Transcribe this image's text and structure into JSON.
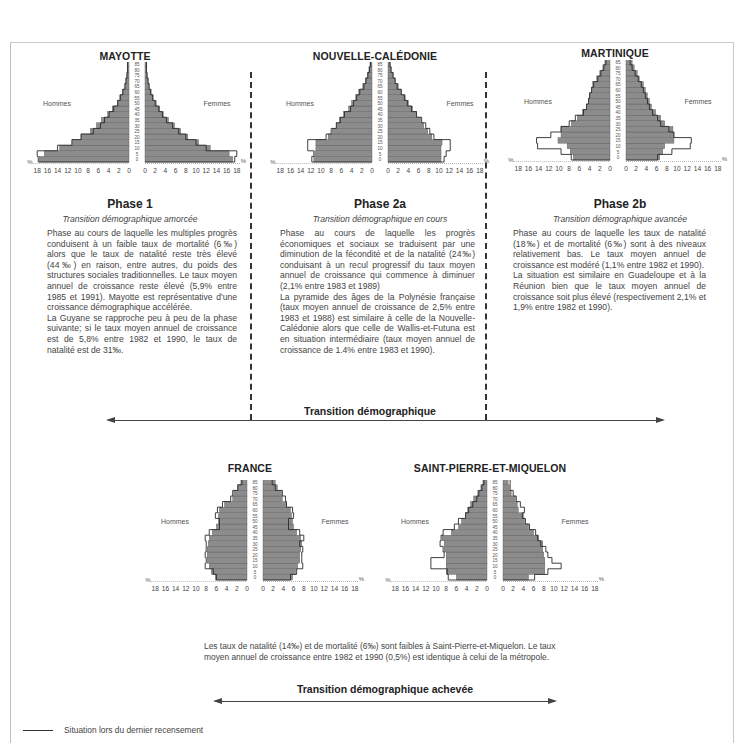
{
  "chart_data": [
    {
      "type": "bar",
      "subtype": "population-pyramid",
      "title": "MAYOTTE",
      "age_groups": [
        "0",
        "5",
        "10",
        "15",
        "20",
        "25",
        "30",
        "35",
        "40",
        "45",
        "50",
        "55",
        "60",
        "65",
        "70",
        "75",
        "80",
        "85",
        "90"
      ],
      "age_unit_label": "ans",
      "axis_ticks": [
        18,
        16,
        14,
        12,
        10,
        8,
        6,
        4,
        2,
        0
      ],
      "axis_unit": "%",
      "left_label": "Hommes",
      "right_label": "Femmes",
      "series": [
        {
          "name": "Hommes (actuel)",
          "values": [
            17.6,
            16.6,
            13.6,
            11.1,
            9.4,
            7.6,
            6.4,
            5.4,
            4.2,
            3.3,
            2.3,
            1.8,
            1.3,
            0.8,
            0.6,
            0.4,
            0.3,
            0.3,
            0.2
          ]
        },
        {
          "name": "Hommes (dernier recensement)",
          "values": [
            17.8,
            18.0,
            14.0,
            11.2,
            9.4,
            7.0,
            5.6,
            4.8,
            3.9,
            3.0,
            2.2,
            1.7,
            1.2,
            0.8,
            0.6,
            0.4,
            0.3,
            0.3,
            0.2
          ]
        },
        {
          "name": "Femmes (actuel)",
          "values": [
            17.2,
            16.5,
            12.8,
            10.5,
            8.4,
            7.0,
            5.8,
            4.6,
            3.6,
            2.9,
            2.2,
            1.6,
            1.2,
            0.8,
            0.6,
            0.4,
            0.3,
            0.3,
            0.2
          ]
        },
        {
          "name": "Femmes (dernier recensement)",
          "values": [
            17.6,
            18.0,
            12.0,
            10.0,
            8.0,
            6.6,
            5.4,
            4.2,
            3.4,
            2.7,
            2.0,
            1.5,
            1.1,
            0.8,
            0.6,
            0.4,
            0.3,
            0.3,
            0.2
          ]
        }
      ],
      "xlim": [
        18,
        18
      ]
    },
    {
      "type": "bar",
      "subtype": "population-pyramid",
      "title": "NOUVELLE-CALÉDONIE",
      "age_groups": [
        "0",
        "5",
        "10",
        "15",
        "20",
        "25",
        "30",
        "35",
        "40",
        "45",
        "50",
        "55",
        "60",
        "65",
        "70",
        "75",
        "80",
        "85",
        "90"
      ],
      "age_unit_label": "ans",
      "axis_ticks": [
        18,
        16,
        14,
        12,
        10,
        8,
        6,
        4,
        2,
        0
      ],
      "axis_unit": "%",
      "left_label": "Hommes",
      "right_label": "Femmes",
      "series": [
        {
          "name": "Hommes (actuel)",
          "values": [
            11.4,
            11.2,
            11.0,
            11.0,
            8.6,
            7.8,
            7.0,
            6.4,
            5.6,
            4.6,
            4.0,
            3.2,
            2.6,
            1.8,
            1.3,
            0.9,
            0.6,
            0.4,
            0.2
          ]
        },
        {
          "name": "Hommes (dernier recensement)",
          "values": [
            11.8,
            11.4,
            12.6,
            12.6,
            9.0,
            8.0,
            7.0,
            6.2,
            5.4,
            4.2,
            3.6,
            3.0,
            2.4,
            1.6,
            1.2,
            0.8,
            0.5,
            0.3,
            0.2
          ]
        },
        {
          "name": "Femmes (actuel)",
          "values": [
            10.4,
            10.4,
            10.4,
            10.6,
            8.6,
            7.8,
            7.0,
            6.4,
            5.6,
            4.8,
            4.0,
            3.4,
            2.6,
            2.0,
            1.4,
            1.0,
            0.6,
            0.4,
            0.2
          ]
        },
        {
          "name": "Femmes (dernier recensement)",
          "values": [
            11.0,
            11.4,
            12.2,
            12.2,
            9.0,
            8.2,
            7.4,
            6.6,
            5.6,
            4.6,
            3.8,
            3.2,
            2.6,
            1.8,
            1.4,
            1.0,
            0.6,
            0.4,
            0.2
          ]
        }
      ],
      "xlim": [
        18,
        18
      ]
    },
    {
      "type": "bar",
      "subtype": "population-pyramid",
      "title": "MARTINIQUE",
      "age_groups": [
        "0",
        "5",
        "10",
        "15",
        "20",
        "25",
        "30",
        "35",
        "40",
        "45",
        "50",
        "55",
        "60",
        "65",
        "70",
        "75",
        "80",
        "85",
        "90"
      ],
      "age_unit_label": "ans",
      "axis_ticks": [
        18,
        16,
        14,
        12,
        10,
        8,
        6,
        4,
        2,
        0
      ],
      "axis_unit": "%",
      "left_label": "Hommes",
      "right_label": "Femmes",
      "series": [
        {
          "name": "Hommes (actuel)",
          "values": [
            7.2,
            7.8,
            8.4,
            10.2,
            9.6,
            9.6,
            7.6,
            6.4,
            5.4,
            4.6,
            4.2,
            4.0,
            3.6,
            3.4,
            2.6,
            2.0,
            1.4,
            1.0,
            0.8
          ]
        },
        {
          "name": "Hommes (dernier recensement)",
          "values": [
            7.6,
            9.6,
            14.2,
            14.4,
            11.6,
            9.6,
            8.0,
            6.8,
            5.2,
            4.6,
            4.2,
            4.0,
            3.6,
            3.2,
            2.4,
            1.8,
            1.2,
            0.8,
            0.6
          ]
        },
        {
          "name": "Femmes (actuel)",
          "values": [
            6.6,
            7.2,
            7.6,
            9.4,
            9.4,
            9.2,
            7.6,
            6.8,
            5.8,
            5.0,
            4.6,
            4.2,
            3.8,
            3.4,
            2.6,
            2.2,
            1.6,
            1.2,
            1.0
          ]
        },
        {
          "name": "Femmes (dernier recensement)",
          "values": [
            6.2,
            9.0,
            12.6,
            12.8,
            9.4,
            8.4,
            6.8,
            6.2,
            5.2,
            4.6,
            4.2,
            3.8,
            3.4,
            3.0,
            2.4,
            1.8,
            1.2,
            0.8,
            0.6
          ]
        }
      ],
      "xlim": [
        18,
        18
      ]
    },
    {
      "type": "bar",
      "subtype": "population-pyramid",
      "title": "FRANCE",
      "age_groups": [
        "0",
        "5",
        "10",
        "15",
        "20",
        "25",
        "30",
        "35",
        "40",
        "45",
        "50",
        "55",
        "60",
        "65",
        "70",
        "75",
        "80",
        "85",
        "90"
      ],
      "age_unit_label": "ans",
      "axis_ticks": [
        18,
        16,
        14,
        12,
        10,
        8,
        6,
        4,
        2,
        0
      ],
      "axis_unit": "%",
      "left_label": "Hommes",
      "right_label": "Femmes",
      "series": [
        {
          "name": "Hommes (actuel)",
          "values": [
            6.2,
            7.0,
            7.4,
            7.8,
            7.8,
            7.8,
            7.6,
            7.4,
            6.8,
            6.0,
            5.6,
            5.6,
            5.4,
            4.4,
            2.8,
            2.6,
            1.8,
            1.2,
            1.2
          ]
        },
        {
          "name": "Hommes (dernier recensement)",
          "values": [
            6.0,
            6.6,
            8.2,
            8.0,
            8.2,
            8.0,
            8.0,
            8.2,
            7.4,
            5.4,
            5.4,
            6.2,
            5.8,
            4.8,
            3.2,
            2.8,
            1.8,
            1.0,
            0.8
          ]
        },
        {
          "name": "Femmes (actuel)",
          "values": [
            5.8,
            6.4,
            6.8,
            7.2,
            7.2,
            7.4,
            7.6,
            7.4,
            6.6,
            6.0,
            5.8,
            5.6,
            5.4,
            4.6,
            3.8,
            3.6,
            2.8,
            2.4,
            2.4
          ]
        },
        {
          "name": "Femmes (dernier recensement)",
          "values": [
            5.4,
            6.6,
            7.8,
            7.6,
            7.6,
            7.8,
            7.2,
            8.0,
            7.2,
            5.0,
            5.0,
            6.0,
            5.8,
            4.6,
            4.4,
            3.8,
            2.4,
            1.8,
            1.8
          ]
        }
      ],
      "xlim": [
        18,
        18
      ]
    },
    {
      "type": "bar",
      "subtype": "population-pyramid",
      "title": "SAINT-PIERRE-ET-MIQUELON",
      "age_groups": [
        "0",
        "5",
        "10",
        "15",
        "20",
        "25",
        "30",
        "35",
        "40",
        "45",
        "50",
        "55",
        "60",
        "65",
        "70",
        "75",
        "80",
        "85",
        "90"
      ],
      "age_unit_label": "ans",
      "axis_ticks": [
        18,
        16,
        14,
        12,
        10,
        8,
        6,
        4,
        2,
        0
      ],
      "axis_unit": "%",
      "left_label": "Hommes",
      "right_label": "Femmes",
      "series": [
        {
          "name": "Hommes (actuel)",
          "values": [
            6.0,
            8.0,
            8.0,
            8.0,
            8.0,
            8.4,
            8.4,
            8.8,
            7.0,
            5.6,
            5.0,
            4.2,
            3.8,
            3.2,
            2.6,
            1.8,
            1.2,
            0.8,
            0.4
          ]
        },
        {
          "name": "Hommes (dernier recensement)",
          "values": [
            7.6,
            7.8,
            11.0,
            11.0,
            8.4,
            8.6,
            9.2,
            9.0,
            8.6,
            6.4,
            5.6,
            4.2,
            3.6,
            2.8,
            2.0,
            1.6,
            1.0,
            0.6,
            0.4
          ]
        },
        {
          "name": "Femmes (actuel)",
          "values": [
            5.0,
            8.2,
            8.2,
            8.2,
            8.0,
            7.8,
            7.8,
            7.0,
            6.0,
            5.0,
            4.2,
            4.0,
            3.0,
            2.8,
            2.4,
            1.6,
            1.2,
            1.0,
            1.0
          ]
        },
        {
          "name": "Femmes (dernier recensement)",
          "values": [
            6.2,
            8.8,
            11.4,
            9.6,
            8.8,
            8.4,
            7.4,
            6.8,
            6.4,
            5.2,
            4.4,
            3.8,
            4.2,
            3.4,
            2.6,
            2.0,
            1.4,
            1.4,
            1.4
          ]
        }
      ],
      "xlim": [
        18,
        18
      ]
    }
  ],
  "columns": [
    {
      "country": "MAYOTTE",
      "phase": "Phase 1",
      "subtitle": "Transition démographique amorcée",
      "paragraphs": [
        "Phase au cours de laquelle les multiples progrès conduisent à un faible taux de mortalité (6‰) alors que le taux de natalité reste très élevé (44‰) en raison, entre autres, du poids des structures sociales traditionnelles. Le taux moyen annuel de croissance reste élevé (5,9% entre 1985 et 1991). Mayotte est représentative d'une croissance démographique accélérée.",
        "La Guyane se rapproche peu à peu de la phase suivante; si le taux moyen annuel de croissance est de 5,8% entre 1982 et 1990, le taux de natalité est de 31‰."
      ]
    },
    {
      "country": "NOUVELLE-CALÉDONIE",
      "phase": "Phase 2a",
      "subtitle": "Transition démographique en cours",
      "paragraphs": [
        "Phase au cours de laquelle les progrès économiques et sociaux se traduisent par une diminution de la fécondité et de la natalité (24‰) conduisant à un recul progressif du taux moyen annuel de croissance qui commence à diminuer (2,1% entre 1983 et 1989)",
        "La pyramide des âges de la Polynésie française (taux moyen annuel de croissance de 2,5% entre 1983 et 1988) est similaire à celle de la Nouvelle-Calédonie alors que celle de Wallis-et-Futuna est en situation intermédiaire (taux moyen annuel de croissance de 1.4% entre 1983 et 1990)."
      ]
    },
    {
      "country": "MARTINIQUE",
      "phase": "Phase 2b",
      "subtitle": "Transition démographique avancée",
      "paragraphs": [
        "Phase au cours de laquelle les taux de natalité (18‰) et de mortalité (6‰) sont à des niveaux relativement bas. Le taux moyen annuel de croissance est modéré (1,1% entre 1982 et 1990).",
        "La situation est similaire en Guadeloupe et à la Réunion bien que le taux moyen annuel de croissance soit plus élevé (respectivement 2,1% et 1,9% entre 1982 et 1990)."
      ]
    }
  ],
  "bottom": {
    "countries": [
      "FRANCE",
      "SAINT-PIERRE-ET-MIQUELON"
    ],
    "paragraph": "Les taux de natalité (14‰) et de mortalité (6‰) sont faibles à Saint-Pierre-et-Miquelon. Le taux moyen annuel de croissance entre 1982 et 1990 (0,5%) est identique à celui de la métropole."
  },
  "arrows": {
    "top_label": "Transition démographique",
    "bottom_label": "Transition démographique achevée"
  },
  "legend": {
    "label": "Situation lors du dernier recensement"
  },
  "colors": {
    "bar_fill": "#8c8c8c",
    "bar_stroke": "#2a2a2a",
    "text": "#333333",
    "frame": "#c4c4c4"
  }
}
